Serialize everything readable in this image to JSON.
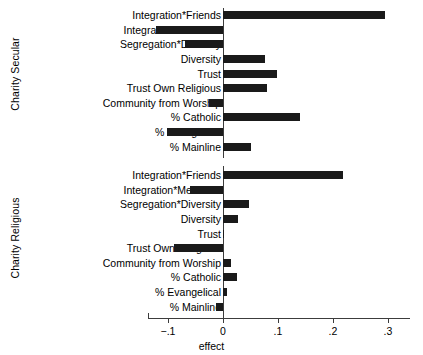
{
  "chart_data": {
    "type": "bar",
    "orientation": "horizontal",
    "title": "",
    "xlabel": "effect",
    "ylabel": "",
    "xlim": [
      -0.145,
      0.34
    ],
    "xticks": [
      -0.1,
      0,
      0.1,
      0.2,
      0.3
    ],
    "xticklabels": [
      "−.1",
      "0",
      ".1",
      ".2",
      ".3"
    ],
    "grid": false,
    "legend": false,
    "zero_reference_line": true,
    "bar_color": "#1a1a1a",
    "panels": [
      {
        "name": "Charity Secular",
        "label": "Charity Secular",
        "categories": [
          "Integration*Friends",
          "Integration*Members",
          "Segregation*Diversity",
          "Diversity",
          "Trust",
          "Trust Own Religious",
          "Community from Worship",
          "% Catholic",
          "% Evangelical",
          "% Mainline"
        ],
        "values": [
          0.295,
          -0.122,
          -0.069,
          0.076,
          0.098,
          0.08,
          -0.025,
          0.14,
          -0.102,
          0.05
        ]
      },
      {
        "name": "Charity Religious",
        "label": "Charity Religious",
        "categories": [
          "Integration*Friends",
          "Integration*Members",
          "Segregation*Diversity",
          "Diversity",
          "Trust",
          "Trust Own Religious",
          "Community from Worship",
          "% Catholic",
          "% Evangelical",
          "% Mainline"
        ],
        "values": [
          0.218,
          -0.06,
          0.048,
          0.028,
          0.002,
          -0.09,
          0.015,
          0.025,
          0.008,
          -0.012
        ]
      }
    ]
  }
}
